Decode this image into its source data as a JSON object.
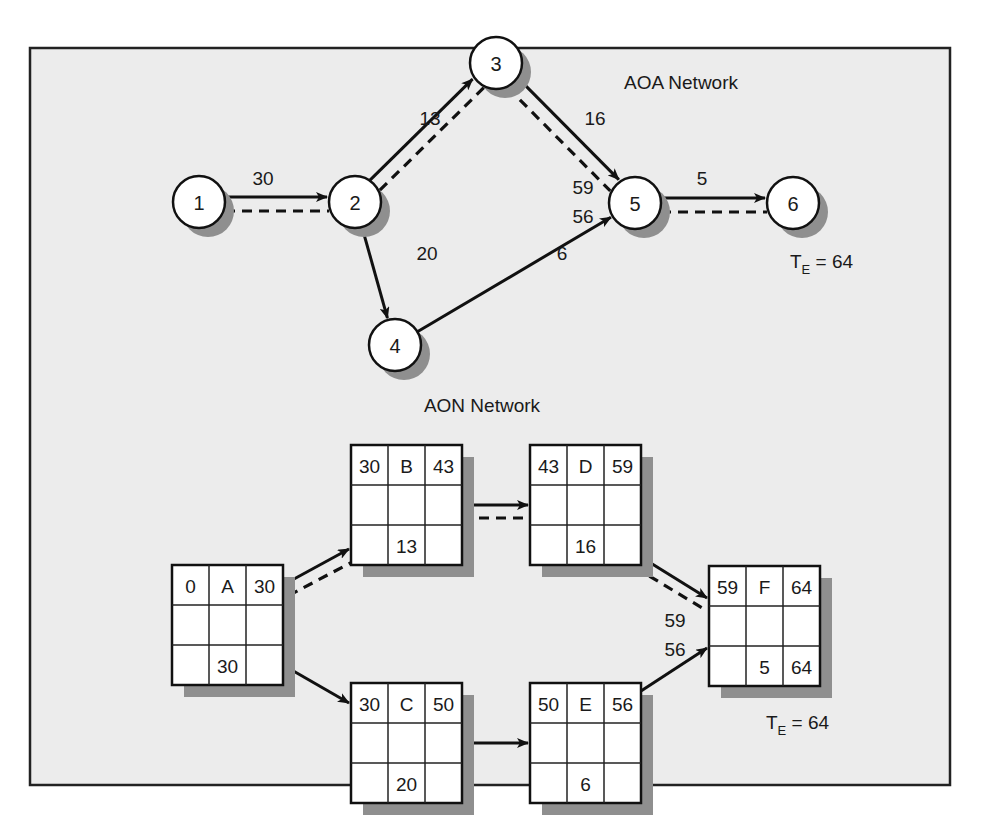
{
  "aoa": {
    "title": "AOA Network",
    "nodes": [
      {
        "id": "1",
        "x": 199,
        "y": 202
      },
      {
        "id": "2",
        "x": 355,
        "y": 202
      },
      {
        "id": "3",
        "x": 496,
        "y": 63
      },
      {
        "id": "4",
        "x": 395,
        "y": 345
      },
      {
        "id": "5",
        "x": 635,
        "y": 203
      },
      {
        "id": "6",
        "x": 793,
        "y": 203
      }
    ],
    "activities": [
      {
        "from": "1",
        "to": "2",
        "duration": "30",
        "critical": true,
        "label_x": 263,
        "label_y": 178
      },
      {
        "from": "2",
        "to": "3",
        "duration": "13",
        "critical": true,
        "label_x": 430,
        "label_y": 118
      },
      {
        "from": "2",
        "to": "4",
        "duration": "20",
        "critical": false,
        "label_x": 427,
        "label_y": 253
      },
      {
        "from": "3",
        "to": "5",
        "duration": "16",
        "critical": true,
        "label_x": 595,
        "label_y": 118
      },
      {
        "from": "4",
        "to": "5",
        "duration": "6",
        "critical": false,
        "label_x": 562,
        "label_y": 253
      },
      {
        "from": "5",
        "to": "6",
        "duration": "5",
        "critical": true,
        "label_x": 702,
        "label_y": 178
      }
    ],
    "path_totals": [
      {
        "value": "59",
        "x": 583,
        "y": 187
      },
      {
        "value": "56",
        "x": 583,
        "y": 216
      }
    ],
    "te": {
      "prefix": "T",
      "sub": "E",
      "value": " = 64",
      "x": 790,
      "y": 268
    }
  },
  "aon": {
    "title": "AON Network",
    "boxes": [
      {
        "id": "A",
        "x": 172,
        "y": 565,
        "es": "0",
        "ef": "30",
        "duration": "30",
        "lf": ""
      },
      {
        "id": "B",
        "x": 351,
        "y": 445,
        "es": "30",
        "ef": "43",
        "duration": "13",
        "lf": ""
      },
      {
        "id": "C",
        "x": 351,
        "y": 683,
        "es": "30",
        "ef": "50",
        "duration": "20",
        "lf": ""
      },
      {
        "id": "D",
        "x": 530,
        "y": 445,
        "es": "43",
        "ef": "59",
        "duration": "16",
        "lf": ""
      },
      {
        "id": "E",
        "x": 530,
        "y": 683,
        "es": "50",
        "ef": "56",
        "duration": "6",
        "lf": ""
      },
      {
        "id": "F",
        "x": 709,
        "y": 566,
        "es": "59",
        "ef": "64",
        "duration": "5",
        "lf": "64"
      }
    ],
    "links": [
      {
        "from": "A",
        "to": "B",
        "critical": true
      },
      {
        "from": "A",
        "to": "C",
        "critical": false
      },
      {
        "from": "B",
        "to": "D",
        "critical": true
      },
      {
        "from": "C",
        "to": "E",
        "critical": false
      },
      {
        "from": "D",
        "to": "F",
        "critical": true
      },
      {
        "from": "E",
        "to": "F",
        "critical": false
      }
    ],
    "path_totals": [
      {
        "value": "59",
        "x": 675,
        "y": 620
      },
      {
        "value": "56",
        "x": 675,
        "y": 649
      }
    ],
    "te": {
      "prefix": "T",
      "sub": "E",
      "value": " = 64",
      "x": 766,
      "y": 729
    }
  },
  "legend": {
    "solid_line": "activity",
    "dashed_line": "critical path"
  }
}
